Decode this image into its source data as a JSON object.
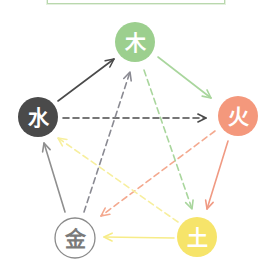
{
  "title_box": {
    "text": ""
  },
  "nodes": [
    {
      "id": "wood",
      "label": "木",
      "cx": 135,
      "cy": 42,
      "r": 20,
      "fill": "#9ccf8e",
      "stroke": "none",
      "text_color": "#ffffff"
    },
    {
      "id": "fire",
      "label": "火",
      "cx": 238,
      "cy": 116,
      "r": 20,
      "fill": "#f4987c",
      "stroke": "none",
      "text_color": "#ffffff"
    },
    {
      "id": "earth",
      "label": "土",
      "cx": 197,
      "cy": 237,
      "r": 20,
      "fill": "#f6e46a",
      "stroke": "none",
      "text_color": "#ffffff"
    },
    {
      "id": "metal",
      "label": "金",
      "cx": 75,
      "cy": 238,
      "r": 20,
      "fill": "#ffffff",
      "stroke": "#8a8a8a",
      "text_color": "#7a7a7a"
    },
    {
      "id": "water",
      "label": "水",
      "cx": 38,
      "cy": 117,
      "r": 20,
      "fill": "#4a4a4a",
      "stroke": "none",
      "text_color": "#ffffff"
    }
  ],
  "edges": {
    "generating": [
      {
        "from": "water",
        "to": "wood",
        "color": "#4a4a4a",
        "x1": 58,
        "y1": 101,
        "x2": 114,
        "y2": 59
      },
      {
        "from": "wood",
        "to": "fire",
        "color": "#a9d69d",
        "x1": 158,
        "y1": 57,
        "x2": 211,
        "y2": 98
      },
      {
        "from": "fire",
        "to": "earth",
        "color": "#f09a83",
        "x1": 228,
        "y1": 141,
        "x2": 207,
        "y2": 209
      },
      {
        "from": "earth",
        "to": "metal",
        "color": "#f7ec88",
        "x1": 174,
        "y1": 238,
        "x2": 104,
        "y2": 237
      },
      {
        "from": "metal",
        "to": "water",
        "color": "#8f8f8f",
        "x1": 65,
        "y1": 212,
        "x2": 44,
        "y2": 143
      }
    ],
    "overcoming": [
      {
        "from": "water",
        "to": "fire",
        "color": "#4a4a4a",
        "x1": 63,
        "y1": 118,
        "x2": 206,
        "y2": 118
      },
      {
        "from": "fire",
        "to": "metal",
        "color": "#f4a98f",
        "x1": 215,
        "y1": 131,
        "x2": 101,
        "y2": 216
      },
      {
        "from": "metal",
        "to": "wood",
        "color": "#8a8a92",
        "x1": 84,
        "y1": 212,
        "x2": 130,
        "y2": 72
      },
      {
        "from": "wood",
        "to": "earth",
        "color": "#a9d69d",
        "x1": 144,
        "y1": 70,
        "x2": 192,
        "y2": 209
      },
      {
        "from": "earth",
        "to": "water",
        "color": "#f7ef9e",
        "x1": 178,
        "y1": 222,
        "x2": 58,
        "y2": 138
      }
    ]
  }
}
